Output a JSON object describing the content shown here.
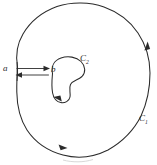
{
  "figure": {
    "background_color": "#ffffff",
    "ink_color": "#2b2b2b",
    "width": 157,
    "height": 165,
    "labels": {
      "point_a": "a",
      "point_b": "b",
      "inner_curve_base": "C",
      "inner_curve_subscript": "2",
      "outer_curve_base": "C",
      "outer_curve_subscript": "1"
    },
    "curves": [
      {
        "name": "outer-contour",
        "label": "C1",
        "orientation": "counterclockwise",
        "arrow_count": 2,
        "arrow_positions": [
          "right-side-upward",
          "bottom-rightward"
        ]
      },
      {
        "name": "inner-contour",
        "label": "C2",
        "orientation": "clockwise",
        "arrow_count": 1,
        "arrow_positions": [
          "bottom-leftward"
        ]
      }
    ],
    "crosscut": {
      "name": "cut-ab",
      "from": "a",
      "to": "b",
      "segments": 2,
      "top_segment_direction": "rightward",
      "bottom_segment_direction": "leftward"
    }
  }
}
